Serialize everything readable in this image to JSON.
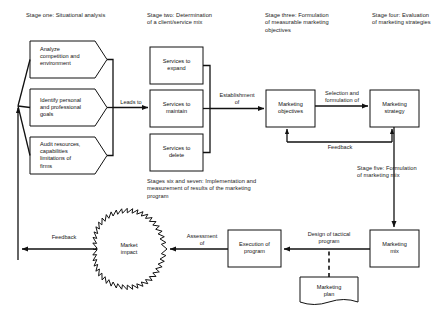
{
  "diagram": {
    "stage_headings": [
      {
        "id": "stage-one",
        "text": "Stage one: Situational analysis"
      },
      {
        "id": "stage-two",
        "text": "Stage two: Determination\nof a client/service mix"
      },
      {
        "id": "stage-three",
        "text": "Stage three: Formulation\nof measurable marketing\nobjectives"
      },
      {
        "id": "stage-four",
        "text": "Stage four: Evaluation\nof marketing strategies"
      },
      {
        "id": "stage-five",
        "text": "Stage five: Formulation\nof marketing mix"
      },
      {
        "id": "stages-six-seven",
        "text": "Stages six and seven: Implementation and\nmeasurement of results of the marketing\nprogram"
      }
    ],
    "nodes": [
      {
        "id": "analyze-competition",
        "shape": "pentagon",
        "text": "Analyze\ncompetition and\nenvironment"
      },
      {
        "id": "identify-goals",
        "shape": "pentagon",
        "text": "Identify personal\nand professional\ngoals"
      },
      {
        "id": "audit-resources",
        "shape": "pentagon",
        "text": "Audit resources,\ncapabilities\nlimitations of\nfirms"
      },
      {
        "id": "services-expand",
        "shape": "rect",
        "text": "Services to\nexpand"
      },
      {
        "id": "services-maintain",
        "shape": "rect",
        "text": "Services to\nmaintain"
      },
      {
        "id": "services-delete",
        "shape": "rect",
        "text": "Services to\ndelete"
      },
      {
        "id": "marketing-objectives",
        "shape": "rect",
        "text": "Marketing\nobjectives"
      },
      {
        "id": "marketing-strategy",
        "shape": "rect",
        "text": "Marketing\nstrategy"
      },
      {
        "id": "marketing-mix",
        "shape": "rect",
        "text": "Marketing\nmix"
      },
      {
        "id": "execution-of-program",
        "shape": "rect",
        "text": "Execution of\nprogram"
      },
      {
        "id": "marketing-plan",
        "shape": "document",
        "text": "Marketing\nplan"
      },
      {
        "id": "market-impact",
        "shape": "starburst",
        "text": "Market\nimpact"
      }
    ],
    "edge_labels": [
      {
        "id": "leads-to",
        "text": "Leads to"
      },
      {
        "id": "establishment-of",
        "text": "Establishment\nof"
      },
      {
        "id": "selection-formulation",
        "text": "Selection and\nformulation of"
      },
      {
        "id": "feedback-objectives-strategy",
        "text": "Feedback"
      },
      {
        "id": "design-tactical-program",
        "text": "Design of tactical\nprogram"
      },
      {
        "id": "assessment-of",
        "text": "Assessment\nof"
      },
      {
        "id": "feedback-left",
        "text": "Feedback"
      }
    ],
    "colors": {
      "stroke": "#111111",
      "text": "#1a1a1a",
      "background": "#ffffff"
    }
  }
}
